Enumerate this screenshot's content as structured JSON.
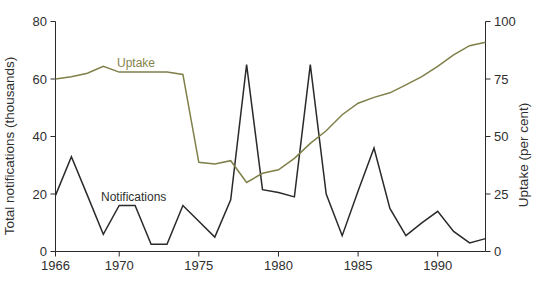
{
  "figure": {
    "background": "#ffffff"
  },
  "chart_data": {
    "type": "line",
    "x": [
      1966,
      1967,
      1968,
      1969,
      1970,
      1971,
      1972,
      1973,
      1974,
      1975,
      1976,
      1977,
      1978,
      1979,
      1980,
      1981,
      1982,
      1983,
      1984,
      1985,
      1986,
      1987,
      1988,
      1989,
      1990,
      1991,
      1992,
      1993
    ],
    "series": [
      {
        "name": "Notifications",
        "axis": "left",
        "color": "#2a2a2a",
        "values": [
          19.5,
          33,
          19.5,
          6,
          16,
          16,
          2.5,
          2.5,
          16,
          10.5,
          5,
          18,
          65,
          21.5,
          20.5,
          19,
          65,
          20,
          5.5,
          21,
          36,
          15,
          5.5,
          10,
          14,
          7,
          3,
          4.5
        ]
      },
      {
        "name": "Uptake",
        "axis": "right",
        "color": "#7f7f49",
        "values": [
          75,
          76,
          77.5,
          80.5,
          78,
          78,
          78,
          78,
          77,
          38.8,
          38,
          39.5,
          30,
          34,
          35.5,
          40.5,
          47,
          52.5,
          59.5,
          64.5,
          67,
          69,
          72.5,
          76,
          80.5,
          85.5,
          89.5,
          91
        ]
      }
    ],
    "left_axis": {
      "label": "Total notifications (thousands)",
      "ticks": [
        0,
        20,
        40,
        60,
        80
      ],
      "range": [
        0,
        80
      ]
    },
    "right_axis": {
      "label": "Uptake (per cent)",
      "ticks": [
        0,
        25,
        50,
        75,
        100
      ],
      "range": [
        0,
        100
      ]
    },
    "x_axis": {
      "ticks": [
        1966,
        1970,
        1975,
        1980,
        1985,
        1990
      ],
      "range": [
        1966,
        1993
      ]
    },
    "labels": {
      "uptake": "Uptake",
      "notifications": "Notifications"
    },
    "label_colors": {
      "uptake": "#84844c",
      "notifications": "#2f2f2f"
    },
    "axis_color": "#2a2a2a",
    "legend_position": "inline",
    "grid": false
  }
}
